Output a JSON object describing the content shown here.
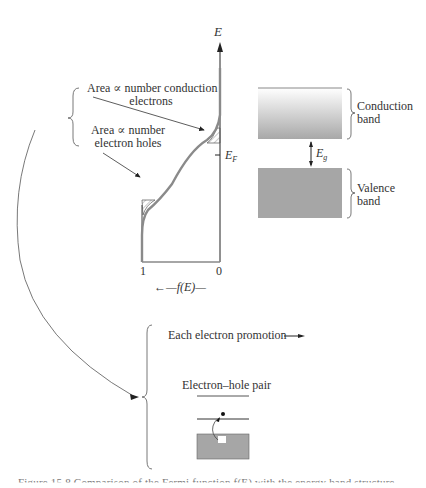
{
  "fermi_plot": {
    "y_axis_label": "E",
    "fermi_level_label": "E",
    "fermi_level_sub": "F",
    "x_tick_left": "1",
    "x_tick_right": "0",
    "x_axis_label": "←—f(E)—",
    "annotation_conduction_line1": "Area ∝ number conduction",
    "annotation_conduction_line2": "electrons",
    "annotation_holes_line1": "Area ∝ number",
    "annotation_holes_line2": "electron holes"
  },
  "band_diagram": {
    "conduction_label_line1": "Conduction",
    "conduction_label_line2": "band",
    "gap_label": "E",
    "gap_sub": "g",
    "valence_label_line1": "Valence",
    "valence_label_line2": "band",
    "colors": {
      "conduction_top": "#ffffff",
      "conduction_bottom": "#a9a9a9",
      "valence": "#a6a6a6"
    }
  },
  "promotion": {
    "text": "Each electron promotion —▸",
    "pair_label": "Electron–hole pair"
  },
  "caption": {
    "text": "Figure 15.8  Comparison of the Fermi function f(E) with the energy band structure"
  }
}
